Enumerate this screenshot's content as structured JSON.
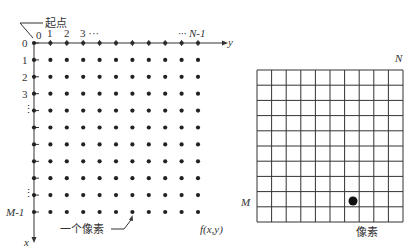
{
  "left_panel": {
    "origin_label": "起点",
    "col_labels": [
      "0",
      "1",
      "2",
      "3 ···",
      "··· N-1"
    ],
    "row_labels": [
      "0",
      "1",
      "2",
      "3",
      "⋮",
      "⋮",
      "M-1"
    ],
    "y_axis_label": "y",
    "x_axis_label": "x",
    "pixel_label": "一个像素",
    "function_label": "f(x,y)",
    "grid_cols": 11,
    "grid_rows": 11
  },
  "right_panel": {
    "n_label": "N",
    "m_label": "M",
    "pixel_label": "像素",
    "grid_cols": 10,
    "grid_rows": 10,
    "highlight_cell": {
      "row": 8,
      "col": 6
    }
  }
}
